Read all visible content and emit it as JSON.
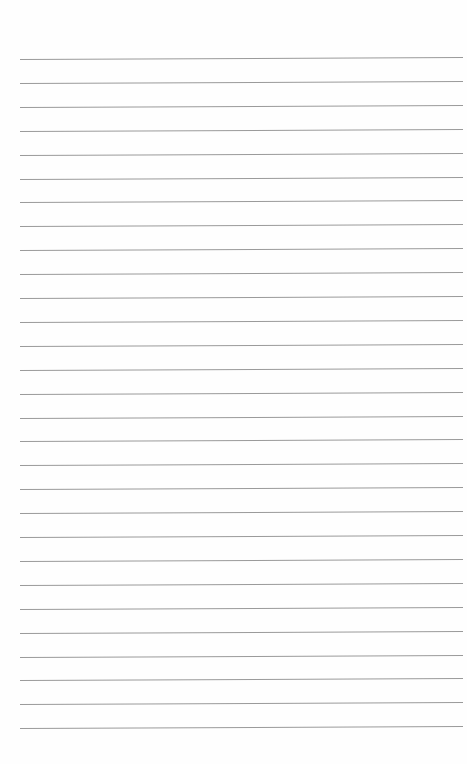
{
  "page": {
    "type": "lined-paper",
    "background_color": "#fefefe",
    "line_color": "#9a9a9a",
    "line_count": 29,
    "first_line_y": 59,
    "line_spacing": 23.9,
    "line_left": 20,
    "line_width": 443,
    "text": []
  }
}
